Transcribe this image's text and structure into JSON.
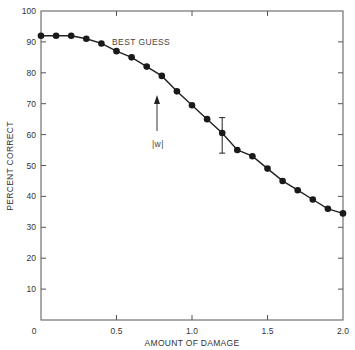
{
  "chart_data": {
    "type": "line",
    "title": "",
    "xlabel": "AMOUNT OF DAMAGE",
    "ylabel": "PERCENT CORRECT",
    "xlim": [
      0,
      2.0
    ],
    "ylim": [
      0,
      100
    ],
    "xticks": [
      0,
      0.5,
      1.0,
      1.5,
      2.0
    ],
    "xtick_labels": [
      "0",
      "0.5",
      "1.0",
      "1.5",
      "2.0"
    ],
    "yticks": [
      0,
      10,
      20,
      30,
      40,
      50,
      60,
      70,
      80,
      90,
      100
    ],
    "ytick_labels": [
      "",
      "10",
      "20",
      "30",
      "40",
      "50",
      "60",
      "70",
      "80",
      "90",
      "100"
    ],
    "grid": false,
    "legend": null,
    "series": [
      {
        "name": "Best guess",
        "marker": "filled-circle",
        "x": [
          0.0,
          0.1,
          0.2,
          0.3,
          0.4,
          0.5,
          0.6,
          0.7,
          0.8,
          0.9,
          1.0,
          1.1,
          1.2,
          1.3,
          1.4,
          1.5,
          1.6,
          1.7,
          1.8,
          1.9,
          2.0
        ],
        "y": [
          92,
          92,
          92,
          91,
          89.5,
          87,
          85,
          82,
          79,
          74,
          69.5,
          65,
          60.5,
          55,
          53,
          49,
          45,
          42,
          39,
          36,
          34.5
        ]
      }
    ],
    "error_bars": [
      {
        "x": 1.2,
        "y": 60.5,
        "low": 54,
        "high": 65.5
      }
    ],
    "annotations": [
      {
        "text": "BEST GUESS",
        "x": 0.47,
        "y": 90.5
      },
      {
        "text": "|w|",
        "x": 0.77,
        "y": 57,
        "arrow_from": [
          0.77,
          61.5
        ],
        "arrow_to": [
          0.77,
          73
        ]
      }
    ],
    "colors": {
      "line": "#222222",
      "marker": "#1a1a1a",
      "axis": "#555555",
      "text": "#333333"
    }
  },
  "labels": {
    "x_axis_title": "AMOUNT OF DAMAGE",
    "y_axis_title": "PERCENT CORRECT",
    "best_guess": "BEST GUESS",
    "w_label": "|w|",
    "origin_label": "0"
  }
}
